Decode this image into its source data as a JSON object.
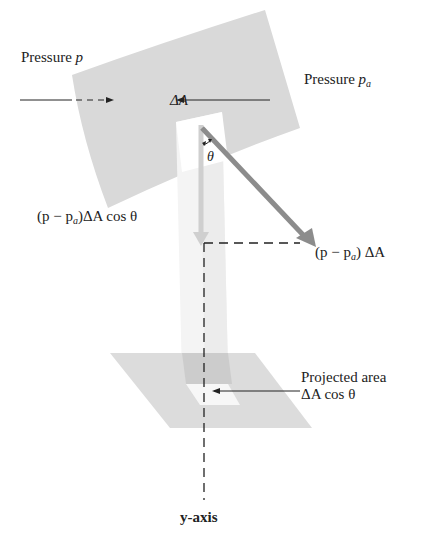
{
  "figure": {
    "type": "physics-diagram"
  },
  "labels": {
    "pressure_left": {
      "text": "Pressure ",
      "symbol": "p"
    },
    "pressure_right": {
      "text": "Pressure ",
      "symbol": "p",
      "subscript": "a"
    },
    "delta_a": "ΔA",
    "theta": "θ",
    "component_force": {
      "prefix": "(p − p",
      "subscript": "a",
      "suffix": ")ΔA cos θ"
    },
    "total_force": {
      "prefix": "(p − p",
      "subscript": "a",
      "suffix": ") ΔA"
    },
    "projected_area_line1": "Projected area",
    "projected_area_line2": "ΔA cos θ",
    "axis": "y-axis"
  },
  "colors": {
    "surface": "#d9d9d9",
    "plane": "#dcdcdc",
    "column": "#f2f2f2",
    "force_vector": "#8c8c8c",
    "component_vector": "#cfcfcf",
    "ink": "#222222"
  }
}
